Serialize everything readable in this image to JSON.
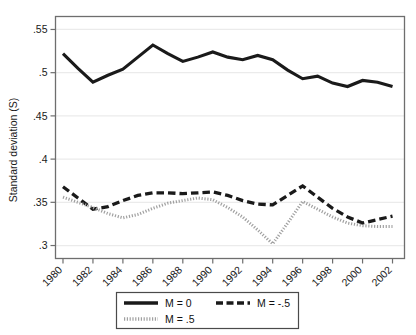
{
  "chart_data": {
    "type": "line",
    "title": "",
    "subtitle": "",
    "xlabel": "",
    "ylabel": "Standard deviation (S)",
    "x": [
      1980,
      1981,
      1982,
      1983,
      1984,
      1985,
      1986,
      1987,
      1988,
      1989,
      1990,
      1991,
      1992,
      1993,
      1994,
      1995,
      1996,
      1997,
      1998,
      1999,
      2000,
      2001,
      2002
    ],
    "xtick_labels": [
      "1980",
      "1982",
      "1984",
      "1986",
      "1988",
      "1990",
      "1992",
      "1994",
      "1996",
      "1998",
      "2000",
      "2002"
    ],
    "xtick_values": [
      1980,
      1982,
      1984,
      1986,
      1988,
      1990,
      1992,
      1994,
      1996,
      1998,
      2000,
      2002
    ],
    "ytick_labels": [
      ".55",
      ".5",
      ".45",
      ".4",
      ".35",
      ".3"
    ],
    "ytick_values": [
      0.55,
      0.5,
      0.45,
      0.4,
      0.35,
      0.3
    ],
    "xlim": [
      1979.5,
      2002.8
    ],
    "ylim": [
      0.285,
      0.565
    ],
    "grid": "horizontal",
    "legend_position": "bottom",
    "series": [
      {
        "name": "M = 0",
        "style": "solid",
        "color": "#1a1a1a",
        "values": [
          0.522,
          0.505,
          0.489,
          0.497,
          0.504,
          0.518,
          0.532,
          0.522,
          0.513,
          0.518,
          0.524,
          0.518,
          0.515,
          0.52,
          0.515,
          0.503,
          0.493,
          0.496,
          0.488,
          0.484,
          0.491,
          0.489,
          0.484
        ]
      },
      {
        "name": "M = -.5",
        "style": "dashed",
        "color": "#1a1a1a",
        "values": [
          0.368,
          0.355,
          0.342,
          0.345,
          0.352,
          0.358,
          0.361,
          0.361,
          0.36,
          0.361,
          0.362,
          0.358,
          0.352,
          0.348,
          0.347,
          0.358,
          0.369,
          0.356,
          0.343,
          0.333,
          0.326,
          0.33,
          0.334
        ]
      },
      {
        "name": "M = .5",
        "style": "dotted",
        "color": "#a0a0a0",
        "values": [
          0.356,
          0.35,
          0.344,
          0.337,
          0.332,
          0.336,
          0.343,
          0.349,
          0.352,
          0.355,
          0.353,
          0.344,
          0.333,
          0.318,
          0.302,
          0.326,
          0.351,
          0.342,
          0.333,
          0.326,
          0.323,
          0.322,
          0.322
        ]
      }
    ]
  },
  "legend": {
    "entries": [
      {
        "label": "M = 0",
        "style": "solid"
      },
      {
        "label": "M = -.5",
        "style": "dashed"
      },
      {
        "label": "M = .5",
        "style": "dotted"
      }
    ]
  },
  "colors": {
    "axis": "#6e6e6e",
    "grid": "#ebebeb",
    "solid_line": "#1a1a1a",
    "dashed_line": "#1a1a1a",
    "dotted_line": "#a0a0a0",
    "text": "#1a1a1a",
    "background": "#ffffff"
  }
}
